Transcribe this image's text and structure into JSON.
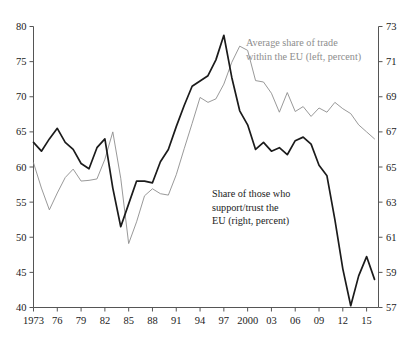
{
  "chart_data": {
    "type": "line",
    "title": "",
    "xlabel": "",
    "ylabel": "",
    "grid": false,
    "legend_position": "inline-annotations",
    "x": [
      1973,
      1974,
      1975,
      1976,
      1977,
      1978,
      1979,
      1980,
      1981,
      1982,
      1983,
      1984,
      1985,
      1986,
      1987,
      1988,
      1989,
      1990,
      1991,
      1992,
      1993,
      1994,
      1995,
      1996,
      1997,
      1998,
      1999,
      2000,
      2001,
      2002,
      2003,
      2004,
      2005,
      2006,
      2007,
      2008,
      2009,
      2010,
      2011,
      2012,
      2013,
      2014,
      2015,
      2016
    ],
    "x_tick_labels": [
      "1973",
      "76",
      "79",
      "82",
      "85",
      "88",
      "91",
      "94",
      "97",
      "2000",
      "03",
      "06",
      "09",
      "12",
      "15"
    ],
    "x_tick_values": [
      1973,
      1976,
      1979,
      1982,
      1985,
      1988,
      1991,
      1994,
      1997,
      2000,
      2003,
      2006,
      2009,
      2012,
      2015
    ],
    "xlim": [
      1973,
      2016.5
    ],
    "left_axis": {
      "label": "Average share of trade within the EU (left, percent)",
      "ylim": [
        40,
        80
      ],
      "ticks": [
        40,
        45,
        50,
        55,
        60,
        65,
        70,
        75,
        80
      ],
      "color": "#8d8d8d"
    },
    "right_axis": {
      "label": "Share of those who support/trust the EU (right, percent)",
      "ylim": [
        57,
        73
      ],
      "ticks": [
        57,
        59,
        61,
        63,
        65,
        67,
        69,
        71,
        73
      ],
      "color": "#1b1b1b"
    },
    "series": [
      {
        "name": "Average share of trade within the EU",
        "axis": "left",
        "units": "percent",
        "color": "#8d8d8d",
        "values": [
          60.6,
          57.0,
          53.9,
          56.3,
          58.5,
          59.7,
          58.0,
          58.1,
          58.3,
          61.1,
          65.0,
          58.4,
          49.1,
          52.2,
          55.9,
          56.9,
          56.2,
          56.0,
          58.9,
          62.6,
          66.2,
          69.9,
          69.2,
          69.7,
          71.8,
          74.9,
          77.2,
          76.6,
          72.3,
          72.1,
          70.5,
          67.8,
          70.6,
          67.9,
          68.6,
          67.2,
          68.4,
          67.8,
          69.2,
          68.3,
          67.6,
          66.0,
          65.0,
          64.0
        ]
      },
      {
        "name": "Share of those who support/trust the EU",
        "axis": "right",
        "units": "percent",
        "color": "#1b1b1b",
        "values": [
          66.4,
          65.9,
          66.6,
          67.2,
          66.4,
          66.0,
          65.2,
          64.9,
          66.1,
          66.6,
          63.8,
          61.6,
          62.9,
          64.2,
          64.2,
          64.1,
          65.3,
          66.0,
          67.3,
          68.5,
          69.6,
          69.9,
          70.2,
          71.1,
          72.5,
          70.1,
          68.2,
          67.4,
          66.0,
          66.4,
          65.9,
          66.1,
          65.7,
          66.5,
          66.7,
          66.3,
          65.1,
          64.5,
          62.0,
          59.2,
          57.1,
          58.8,
          59.9,
          58.6
        ]
      }
    ],
    "annotations": [
      {
        "id": "trade-annotation",
        "lines": [
          "Average share of trade",
          "within the EU (left, percent)"
        ],
        "color": "#8d8d8d"
      },
      {
        "id": "trust-annotation",
        "lines": [
          "Share of those who",
          "support/trust the",
          "EU (right, percent)"
        ],
        "color": "#1b1b1b"
      }
    ]
  }
}
